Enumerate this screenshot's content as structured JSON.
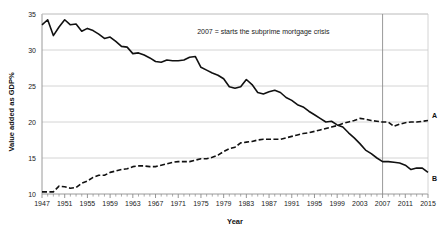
{
  "chart_data": {
    "type": "line",
    "title": "",
    "xlabel": "Year",
    "ylabel": "Value added as GDP%",
    "xlim": [
      1947,
      2015
    ],
    "ylim": [
      10,
      35
    ],
    "grid": true,
    "legend_position": "right-inline",
    "xticks": [
      1947,
      1951,
      1955,
      1959,
      1963,
      1967,
      1971,
      1975,
      1979,
      1983,
      1987,
      1991,
      1995,
      1999,
      2003,
      2007,
      2011,
      2015
    ],
    "yticks": [
      10,
      15,
      20,
      25,
      30,
      35
    ],
    "annotations": [
      {
        "name": "subprime-crisis-note",
        "text": "2007 = starts the subprime mortgage crisis",
        "x": 1986,
        "y": 32.2
      },
      {
        "name": "crisis-marker-line",
        "type": "vline",
        "x": 2007
      }
    ],
    "x": [
      1947,
      1948,
      1949,
      1950,
      1951,
      1952,
      1953,
      1954,
      1955,
      1956,
      1957,
      1958,
      1959,
      1960,
      1961,
      1962,
      1963,
      1964,
      1965,
      1966,
      1967,
      1968,
      1969,
      1970,
      1971,
      1972,
      1973,
      1974,
      1975,
      1976,
      1977,
      1978,
      1979,
      1980,
      1981,
      1982,
      1983,
      1984,
      1985,
      1986,
      1987,
      1988,
      1989,
      1990,
      1991,
      1992,
      1993,
      1994,
      1995,
      1996,
      1997,
      1998,
      1999,
      2000,
      2001,
      2002,
      2003,
      2004,
      2005,
      2006,
      2007,
      2008,
      2009,
      2010,
      2011,
      2012,
      2013,
      2014,
      2015
    ],
    "series": [
      {
        "name": "A",
        "label": "A",
        "style": "dashed",
        "color": "#111111",
        "end_label_value": 20.2,
        "values": [
          10.3,
          10.3,
          10.3,
          11.1,
          11.0,
          10.8,
          10.9,
          11.5,
          11.8,
          12.3,
          12.6,
          12.6,
          13.0,
          13.2,
          13.4,
          13.5,
          13.8,
          13.9,
          13.9,
          13.8,
          13.8,
          14.0,
          14.2,
          14.4,
          14.5,
          14.5,
          14.5,
          14.7,
          14.9,
          14.9,
          15.1,
          15.4,
          15.9,
          16.3,
          16.5,
          17.1,
          17.2,
          17.3,
          17.5,
          17.6,
          17.6,
          17.6,
          17.6,
          17.8,
          18.0,
          18.2,
          18.4,
          18.5,
          18.7,
          18.9,
          19.1,
          19.3,
          19.5,
          19.8,
          20.0,
          20.2,
          20.5,
          20.4,
          20.2,
          20.1,
          20.0,
          20.0,
          19.4,
          19.7,
          19.9,
          20.0,
          20.0,
          20.1,
          20.2
        ]
      },
      {
        "name": "B",
        "label": "B",
        "style": "solid",
        "color": "#111111",
        "end_label_value": 13.0,
        "values": [
          33.5,
          34.2,
          32.0,
          33.2,
          34.2,
          33.5,
          33.6,
          32.6,
          33.0,
          32.7,
          32.2,
          31.6,
          31.8,
          31.2,
          30.5,
          30.4,
          29.5,
          29.6,
          29.3,
          28.9,
          28.4,
          28.3,
          28.6,
          28.5,
          28.5,
          28.6,
          29.0,
          29.1,
          27.6,
          27.2,
          26.8,
          26.5,
          26.0,
          24.9,
          24.7,
          24.9,
          25.9,
          25.2,
          24.1,
          23.9,
          24.2,
          24.4,
          24.1,
          23.4,
          23.0,
          22.4,
          22.1,
          21.5,
          21.0,
          20.5,
          20.0,
          20.1,
          19.6,
          19.3,
          18.5,
          17.8,
          17.0,
          16.1,
          15.6,
          15.0,
          14.5,
          14.5,
          14.4,
          14.3,
          14.0,
          13.4,
          13.6,
          13.6,
          13.0
        ]
      }
    ]
  }
}
